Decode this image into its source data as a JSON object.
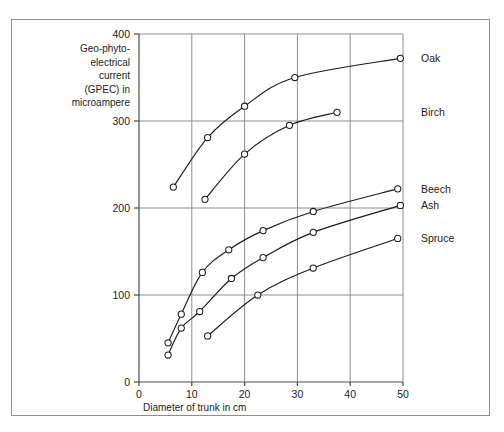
{
  "chart_data": {
    "type": "line",
    "title": "",
    "xlabel": "Diameter of trunk in cm",
    "ylabel": "Geo-phyto-electrical current (GPEC) in microampere",
    "ylabel_lines": [
      "Geo-phyto-",
      "electrical",
      "current",
      "(GPEC) in",
      "microampere"
    ],
    "xlim": [
      0,
      50
    ],
    "ylim": [
      0,
      400
    ],
    "xticks": [
      0,
      10,
      20,
      30,
      40,
      50
    ],
    "yticks": [
      0,
      100,
      200,
      300,
      400
    ],
    "xticklabels": [
      "0",
      "10",
      "20",
      "30",
      "40",
      "50"
    ],
    "yticklabels": [
      "0",
      "100",
      "200",
      "300",
      "400"
    ],
    "grid": true,
    "legend_position": "right-of-plot-at-series-end",
    "marker": "open-circle",
    "line_color": "#1b1b1b",
    "grid_color": "#8d8d8d",
    "series": [
      {
        "name": "Oak",
        "label": "Oak",
        "points": [
          {
            "x": 6.5,
            "y": 224
          },
          {
            "x": 13.0,
            "y": 281
          },
          {
            "x": 20.0,
            "y": 317
          },
          {
            "x": 29.5,
            "y": 350
          },
          {
            "x": 49.5,
            "y": 372
          }
        ]
      },
      {
        "name": "Birch",
        "label": "Birch",
        "points": [
          {
            "x": 12.5,
            "y": 210
          },
          {
            "x": 20.0,
            "y": 262
          },
          {
            "x": 28.5,
            "y": 295
          },
          {
            "x": 37.5,
            "y": 310
          }
        ]
      },
      {
        "name": "Beech",
        "label": "Beech",
        "points": [
          {
            "x": 5.5,
            "y": 45
          },
          {
            "x": 8.0,
            "y": 78
          },
          {
            "x": 12.0,
            "y": 126
          },
          {
            "x": 17.0,
            "y": 152
          },
          {
            "x": 23.5,
            "y": 174
          },
          {
            "x": 33.0,
            "y": 196
          },
          {
            "x": 49.0,
            "y": 222
          }
        ]
      },
      {
        "name": "Ash",
        "label": "Ash",
        "points": [
          {
            "x": 5.5,
            "y": 31
          },
          {
            "x": 8.0,
            "y": 62
          },
          {
            "x": 11.5,
            "y": 81
          },
          {
            "x": 17.5,
            "y": 119
          },
          {
            "x": 23.5,
            "y": 143
          },
          {
            "x": 33.0,
            "y": 172
          },
          {
            "x": 49.5,
            "y": 203
          }
        ]
      },
      {
        "name": "Spruce",
        "label": "Spruce",
        "points": [
          {
            "x": 13.0,
            "y": 53
          },
          {
            "x": 22.5,
            "y": 100
          },
          {
            "x": 33.0,
            "y": 131
          },
          {
            "x": 49.0,
            "y": 165
          }
        ]
      }
    ]
  }
}
